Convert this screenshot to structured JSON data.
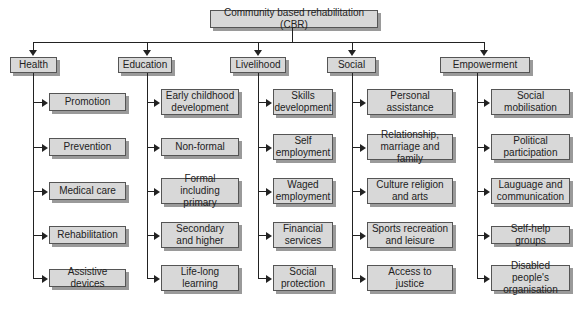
{
  "root": {
    "label": "Community based rehabilitation (CBR)"
  },
  "colors": {
    "box_fill": "#d8d8d8",
    "box_border": "#555555",
    "box_shadow": "#9a9a9a",
    "line": "#222222",
    "background": "#ffffff"
  },
  "categories": [
    {
      "label": "Health",
      "items": [
        "Promotion",
        "Prevention",
        "Medical care",
        "Rehabilitation",
        "Assistive devices"
      ]
    },
    {
      "label": "Education",
      "items": [
        "Early childhood\ndevelopment",
        "Non-formal",
        "Formal\nincluding primary",
        "Secondary\nand higher",
        "Life-long\nlearning"
      ]
    },
    {
      "label": "Livelihood",
      "items": [
        "Skills\ndevelopment",
        "Self\nemployment",
        "Waged\nemployment",
        "Financial\nservices",
        "Social\nprotection"
      ]
    },
    {
      "label": "Social",
      "items": [
        "Personal\nassistance",
        "Relationship,\nmarriage and family",
        "Culture religion\nand arts",
        "Sports recreation\nand leisure",
        "Access to\njustice"
      ]
    },
    {
      "label": "Empowerment",
      "items": [
        "Social\nmobilisation",
        "Political\nparticipation",
        "Lauguage and\ncommunication",
        "Self-help groups",
        "Disabled people's\norganisation"
      ]
    }
  ]
}
